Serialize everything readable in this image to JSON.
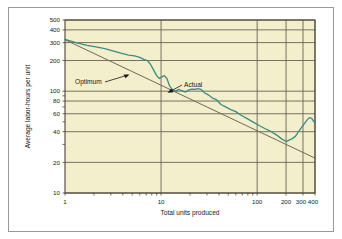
{
  "figure": {
    "background": "#f3eecb",
    "border_color": "#9a9a9a",
    "grid_color": "#6b6353",
    "axis_color": "#4a4438"
  },
  "chart_data": {
    "type": "line",
    "title": "",
    "xlabel": "Total units produced",
    "ylabel": "Average labor-hours per unit",
    "xscale": "log",
    "yscale": "log",
    "xlim": [
      1,
      400
    ],
    "ylim": [
      10,
      500
    ],
    "grid": true,
    "legend_position": "inline-annotations",
    "xticks": [
      1,
      10,
      100,
      200,
      300,
      400
    ],
    "xtick_labels": [
      "1",
      "10",
      "100",
      "200",
      "300 400"
    ],
    "yticks": [
      10,
      20,
      40,
      60,
      80,
      100,
      200,
      300,
      400,
      500
    ],
    "ytick_labels": [
      "10",
      "20",
      "40",
      "60",
      "80",
      "100",
      "200",
      "300",
      "400",
      "500"
    ],
    "annotations": [
      {
        "text": "Optimum",
        "target_series": "Optimum"
      },
      {
        "text": "Actual",
        "target_series": "Actual"
      }
    ],
    "series": [
      {
        "name": "Optimum",
        "color": "#6e6a58",
        "description": "straight learning curve on log-log axes",
        "x": [
          1,
          400
        ],
        "y": [
          320,
          22
        ]
      },
      {
        "name": "Actual",
        "color": "#3e8b84",
        "description": "observed labor hours wandering about the optimum curve",
        "x": [
          1,
          1.3,
          1.7,
          2.1,
          2.6,
          3.2,
          3.9,
          4.6,
          5.3,
          6.0,
          6.6,
          7.2,
          7.8,
          8.4,
          9.0,
          9.6,
          10.2,
          10.8,
          11.5,
          12.3,
          13.2,
          14.2,
          15.3,
          16.5,
          18.0,
          19.5,
          21.0,
          22.5,
          24.0,
          26.0,
          28.5,
          31.0,
          34.0,
          38.0,
          42.0,
          47.0,
          53.0,
          60.0,
          68.0,
          78.0,
          90.0,
          105.0,
          120.0,
          140.0,
          160.0,
          180.0,
          200.0,
          215.0,
          230.0,
          250.0,
          270.0,
          290.0,
          310.0,
          330.0,
          350.0,
          370.0,
          390.0,
          400.0
        ],
        "y": [
          322,
          300,
          282,
          272,
          262,
          248,
          235,
          226,
          222,
          215,
          205,
          200,
          182,
          160,
          142,
          133,
          138,
          142,
          133,
          112,
          103,
          100,
          104,
          101,
          98,
          103,
          105,
          104,
          106,
          104,
          96,
          92,
          86,
          82,
          74,
          70,
          66,
          63,
          58,
          54,
          50,
          46,
          43,
          40,
          37,
          34,
          32,
          33,
          34,
          36,
          40,
          44,
          48,
          52,
          55,
          54,
          50,
          52
        ]
      }
    ]
  }
}
